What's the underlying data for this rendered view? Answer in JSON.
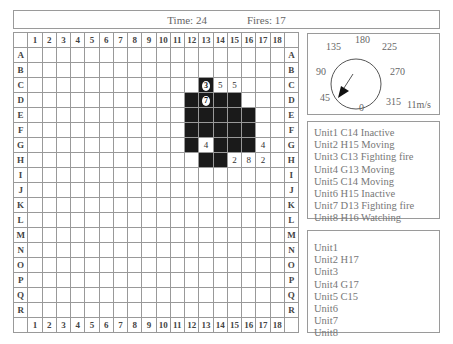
{
  "header": {
    "time_label": "Time: 24",
    "fires_label": "Fires: 17"
  },
  "grid": {
    "columns": [
      "1",
      "2",
      "3",
      "4",
      "5",
      "6",
      "7",
      "8",
      "9",
      "10",
      "11",
      "12",
      "13",
      "14",
      "15",
      "16",
      "17",
      "18"
    ],
    "rows": [
      "A",
      "B",
      "C",
      "D",
      "E",
      "F",
      "G",
      "H",
      "I",
      "J",
      "K",
      "L",
      "M",
      "N",
      "O",
      "P",
      "Q",
      "R"
    ],
    "fire_cells": [
      "C13",
      "D12",
      "D13",
      "D14",
      "D15",
      "E12",
      "E13",
      "E14",
      "E15",
      "E16",
      "F12",
      "F13",
      "F14",
      "F15",
      "F16",
      "G12",
      "G14",
      "G15",
      "G16",
      "H13",
      "H14"
    ],
    "annotations": [
      {
        "cell": "C13",
        "text": "3",
        "style": "oval-on-fire"
      },
      {
        "cell": "C14",
        "text": "5",
        "style": "plain"
      },
      {
        "cell": "C15",
        "text": "5",
        "style": "plain"
      },
      {
        "cell": "D13",
        "text": "7",
        "style": "oval-on-fire"
      },
      {
        "cell": "G13",
        "text": "4",
        "style": "plain"
      },
      {
        "cell": "G17",
        "text": "4",
        "style": "plain"
      },
      {
        "cell": "H15",
        "text": "2",
        "style": "plain"
      },
      {
        "cell": "H16",
        "text": "8",
        "style": "plain"
      },
      {
        "cell": "H17",
        "text": "2",
        "style": "plain"
      }
    ],
    "colors": {
      "fire": "#1a1a1a",
      "line": "#999999"
    }
  },
  "compass": {
    "labels": [
      {
        "text": "180",
        "x": 47,
        "y": 0
      },
      {
        "text": "135",
        "x": 18,
        "y": 7
      },
      {
        "text": "225",
        "x": 74,
        "y": 7
      },
      {
        "text": "90",
        "x": 8,
        "y": 32
      },
      {
        "text": "270",
        "x": 82,
        "y": 32
      },
      {
        "text": "45",
        "x": 12,
        "y": 58
      },
      {
        "text": "315",
        "x": 78,
        "y": 62
      },
      {
        "text": "0",
        "x": 51,
        "y": 68
      }
    ],
    "wind_speed": "11m/s",
    "wind_direction_deg": 45
  },
  "unit_status": [
    "Unit1 C14 Inactive",
    "Unit2 H15 Moving",
    "Unit3 C13 Fighting fire",
    "Unit4 G13 Moving",
    "Unit5 C14 Moving",
    "Unit6 H15 Inactive",
    "Unit7 D13 Fighting fire",
    "Unit8 H16 Watching"
  ],
  "unit_positions": [
    "Unit1",
    "Unit2 H17",
    "Unit3",
    "Unit4 G17",
    "Unit5 C15",
    "Unit6",
    "Unit7",
    "Unit8"
  ]
}
